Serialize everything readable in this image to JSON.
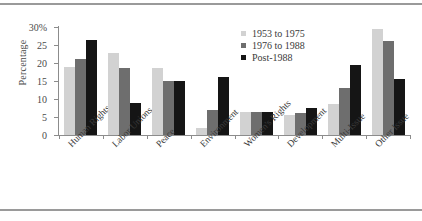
{
  "chart_data": {
    "type": "bar",
    "title": "",
    "xlabel": "",
    "ylabel": "Percentage",
    "ylim": [
      0,
      30
    ],
    "grid": false,
    "legend_position": "top-right",
    "ytick_labels": [
      "30%",
      "25",
      "20",
      "15",
      "10",
      "5",
      "0"
    ],
    "ytick_values": [
      30,
      25,
      20,
      15,
      10,
      5,
      0
    ],
    "categories": [
      "Human Rights",
      "Labor Unions",
      "Peace",
      "Environment",
      "Women's Rights",
      "Development",
      "Multi-Issue",
      "Other Issue"
    ],
    "series": [
      {
        "name": "1953 to 1975",
        "color": "#d2d2d2",
        "values": [
          19.0,
          22.8,
          18.5,
          2.0,
          6.5,
          5.5,
          8.5,
          29.5
        ]
      },
      {
        "name": "1976 to 1988",
        "color": "#6e6e6e",
        "values": [
          21.0,
          18.7,
          15.0,
          7.0,
          6.3,
          6.0,
          13.0,
          26.0
        ]
      },
      {
        "name": "Post-1988",
        "color": "#151515",
        "values": [
          26.5,
          9.0,
          15.0,
          16.0,
          6.5,
          7.5,
          19.5,
          15.5
        ]
      }
    ]
  },
  "legend": {
    "items": [
      {
        "label": "1953 to 1975"
      },
      {
        "label": "1976 to 1988"
      },
      {
        "label": "Post-1988"
      }
    ]
  },
  "axes": {
    "y_title": "Percentage"
  }
}
